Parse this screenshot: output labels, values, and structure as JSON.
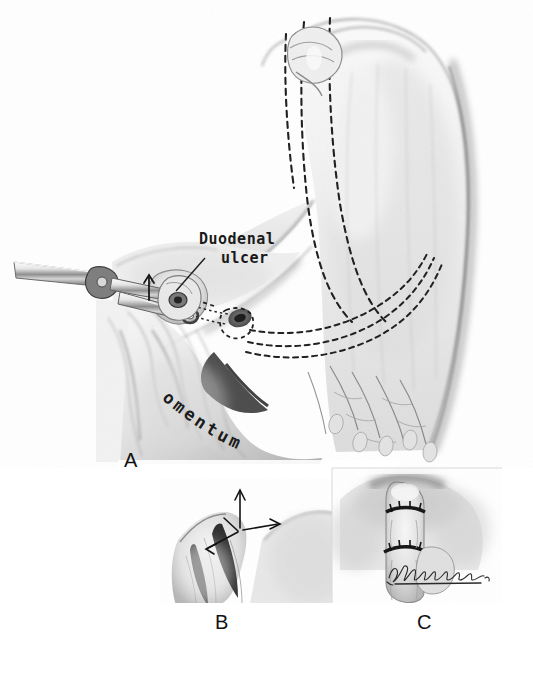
{
  "figure": {
    "kind": "medical-illustration",
    "background_color": "#ffffff",
    "ink_color": "#1a1a1a",
    "width": 533,
    "height": 680
  },
  "labels": {
    "duodenal_ulcer_line1": "Duodenal",
    "duodenal_ulcer_line2": "ulcer",
    "omentum": "omentum"
  },
  "panels": [
    {
      "letter": "A",
      "caption": "",
      "contents": "Stomach and duodenum with surgical clamps, duodenal ulcer labeled, omentum below, dashed resection lines"
    },
    {
      "letter": "B",
      "caption": "",
      "contents": "Close-up of tissue held with traction arrows indicating direction of pull"
    },
    {
      "letter": "C",
      "caption": "",
      "contents": "Closed defect with placed sutures; artist signature at lower right"
    }
  ],
  "annotations": {
    "traction_arrow_up": "arrow-up",
    "traction_arrow_right": "arrow-right",
    "clamp_arrow": "arrow-up",
    "dashed_resection_lines": "dashed",
    "leader_line": "duodenal-ulcer-leader"
  },
  "signature": {
    "present": true,
    "text": "",
    "description": "cursive artist signature"
  }
}
